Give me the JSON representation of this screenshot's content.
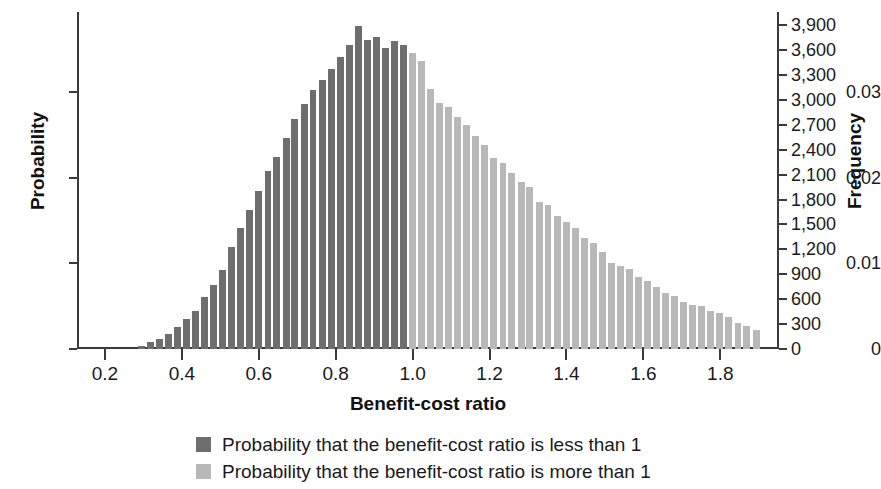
{
  "chart_data": {
    "type": "bar",
    "title": "",
    "subtitle": "",
    "xlabel": "Benefit-cost ratio",
    "ylabel": "Probability",
    "y2label": "Frequency",
    "grid": false,
    "legend_position": "bottom",
    "xlim": [
      0.13,
      1.95
    ],
    "ylim": [
      0,
      0.0394
    ],
    "y2lim": [
      0,
      4060
    ],
    "x_ticks": [
      0.2,
      0.4,
      0.6,
      0.8,
      1.0,
      1.2,
      1.4,
      1.6,
      1.8
    ],
    "x_tick_labels": [
      "0.2",
      "0.4",
      "0.6",
      "0.8",
      "1.0",
      "1.2",
      "1.4",
      "1.6",
      "1.8"
    ],
    "y_ticks": [
      0,
      0.01,
      0.02,
      0.03
    ],
    "y_tick_labels": [
      "0",
      "0.01",
      "0.02",
      "0.03"
    ],
    "y2_ticks": [
      0,
      300,
      600,
      900,
      1200,
      1500,
      1800,
      2100,
      2400,
      2700,
      3000,
      3300,
      3600,
      3900
    ],
    "y2_tick_labels": [
      "0",
      "300",
      "600",
      "900",
      "1,200",
      "1,500",
      "1,800",
      "2,100",
      "2,400",
      "2,700",
      "3,000",
      "3,300",
      "3,600",
      "3,900"
    ],
    "bin_width": 0.0235,
    "threshold": 1.0,
    "colors": {
      "below_threshold": "#6e6e6e",
      "above_threshold": "#b8b8b8",
      "axis": "#3a3a3a",
      "text": "#1a1a1a"
    },
    "legend": [
      {
        "label": "Probability that the benefit-cost ratio is less than 1",
        "color": "#6e6e6e"
      },
      {
        "label": "Probability that the benefit-cost ratio is more than 1",
        "color": "#b8b8b8"
      }
    ],
    "series": [
      {
        "name": "Benefit-cost ratio distribution",
        "x": [
          0.295,
          0.318,
          0.342,
          0.365,
          0.389,
          0.412,
          0.436,
          0.459,
          0.483,
          0.506,
          0.53,
          0.553,
          0.577,
          0.6,
          0.624,
          0.647,
          0.671,
          0.694,
          0.718,
          0.741,
          0.765,
          0.788,
          0.812,
          0.835,
          0.859,
          0.882,
          0.906,
          0.929,
          0.953,
          0.976,
          1.0,
          1.023,
          1.047,
          1.07,
          1.094,
          1.117,
          1.141,
          1.164,
          1.188,
          1.211,
          1.235,
          1.258,
          1.282,
          1.305,
          1.329,
          1.352,
          1.376,
          1.399,
          1.423,
          1.446,
          1.47,
          1.493,
          1.517,
          1.54,
          1.564,
          1.587,
          1.611,
          1.634,
          1.658,
          1.681,
          1.705,
          1.728,
          1.752,
          1.775,
          1.799,
          1.822,
          1.846,
          1.869,
          1.893
        ],
        "probability": [
          0.0003,
          0.0008,
          0.0012,
          0.0017,
          0.0026,
          0.0035,
          0.0045,
          0.0061,
          0.0075,
          0.0092,
          0.0119,
          0.0141,
          0.0163,
          0.0185,
          0.0208,
          0.0225,
          0.0247,
          0.0269,
          0.0287,
          0.0303,
          0.0315,
          0.0327,
          0.0341,
          0.0356,
          0.0378,
          0.0361,
          0.0365,
          0.0352,
          0.036,
          0.0356,
          0.0346,
          0.0337,
          0.0304,
          0.0288,
          0.0283,
          0.0271,
          0.0262,
          0.0249,
          0.0239,
          0.0223,
          0.0217,
          0.0206,
          0.0195,
          0.0189,
          0.0172,
          0.0168,
          0.0156,
          0.0149,
          0.0141,
          0.013,
          0.0124,
          0.0114,
          0.0101,
          0.0097,
          0.0094,
          0.0084,
          0.008,
          0.0073,
          0.0066,
          0.0062,
          0.0055,
          0.0052,
          0.005,
          0.0044,
          0.0042,
          0.0038,
          0.0031,
          0.0027,
          0.0022
        ],
        "frequency": [
          31,
          82,
          124,
          175,
          268,
          361,
          464,
          629,
          773,
          948,
          1226,
          1453,
          1680,
          1907,
          2144,
          2319,
          2546,
          2773,
          2958,
          3123,
          3247,
          3371,
          3515,
          3670,
          3896,
          3721,
          3762,
          3628,
          3711,
          3670,
          3566,
          3474,
          3134,
          2969,
          2917,
          2793,
          2700,
          2567,
          2463,
          2299,
          2237,
          2123,
          2010,
          1948,
          1773,
          1732,
          1608,
          1536,
          1453,
          1340,
          1278,
          1175,
          1041,
          1000,
          969,
          866,
          825,
          752,
          680,
          639,
          567,
          536,
          515,
          454,
          433,
          392,
          320,
          278,
          227
        ]
      }
    ]
  }
}
